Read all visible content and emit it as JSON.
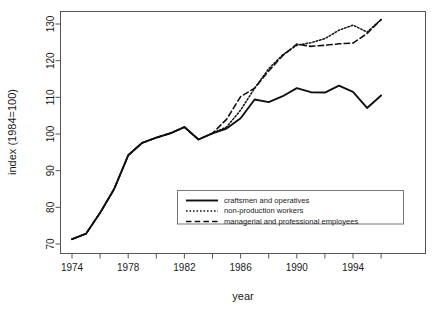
{
  "chart_data": {
    "type": "line",
    "title": "",
    "xlabel": "year",
    "ylabel": "index (1984=100)",
    "xlim": [
      1974,
      1996
    ],
    "ylim": [
      70,
      133
    ],
    "grid": false,
    "legend_position": "bottom-center-inside",
    "x_ticks_major": [
      1974,
      1978,
      1982,
      1986,
      1990,
      1994
    ],
    "x_ticks_minor": [
      1976,
      1980,
      1984,
      1988,
      1992,
      1996
    ],
    "y_ticks": [
      70,
      80,
      90,
      100,
      110,
      120,
      130
    ],
    "x": [
      1974,
      1975,
      1976,
      1977,
      1978,
      1979,
      1980,
      1981,
      1982,
      1983,
      1984,
      1985,
      1986,
      1987,
      1988,
      1989,
      1990,
      1991,
      1992,
      1993,
      1994,
      1995,
      1996
    ],
    "series": [
      {
        "name": "craftsmen and operatives",
        "style": "solid",
        "values": [
          71.3,
          72.8,
          78.5,
          85.0,
          94.2,
          97.6,
          99.0,
          100.2,
          101.9,
          98.5,
          100.2,
          101.5,
          104.3,
          109.4,
          108.7,
          110.3,
          112.5,
          111.4,
          111.3,
          113.2,
          111.5,
          107.1,
          110.5
        ]
      },
      {
        "name": "non-production workers",
        "style": "dotted",
        "values": [
          71.3,
          72.8,
          78.5,
          85.0,
          94.2,
          97.6,
          99.0,
          100.2,
          101.9,
          98.5,
          100.2,
          101.9,
          106.5,
          112.5,
          117.8,
          121.6,
          124.2,
          124.9,
          126.0,
          128.3,
          129.7,
          127.8,
          131.2
        ]
      },
      {
        "name": "managerial and professional employees",
        "style": "dashed",
        "values": [
          71.3,
          72.8,
          78.5,
          85.0,
          94.2,
          97.6,
          99.0,
          100.2,
          101.9,
          98.5,
          100.2,
          104.0,
          110.2,
          112.5,
          117.2,
          121.4,
          124.5,
          123.9,
          124.2,
          124.6,
          124.8,
          127.4,
          131.2
        ]
      }
    ]
  },
  "legend": {
    "entries": [
      {
        "label": "craftsmen and operatives",
        "style": "solid"
      },
      {
        "label": "non-production workers",
        "style": "dotted"
      },
      {
        "label": "managerial and professional employees",
        "style": "dashed"
      }
    ]
  },
  "axes": {
    "x_title": "year",
    "y_title": "index (1984=100)",
    "x_tick_labels": [
      "1974",
      "1978",
      "1982",
      "1986",
      "1990",
      "1994"
    ],
    "y_tick_labels": [
      "70",
      "80",
      "90",
      "100",
      "110",
      "120",
      "130"
    ]
  },
  "colors": {
    "line": "#111111",
    "frame": "#555555",
    "text": "#1a1a1a",
    "background": "#ffffff"
  }
}
